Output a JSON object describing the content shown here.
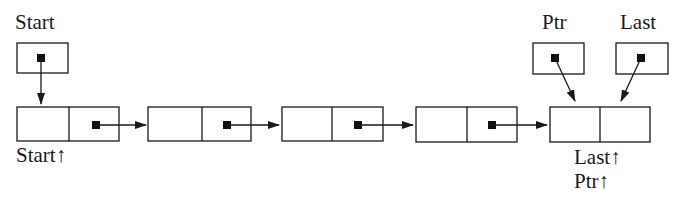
{
  "diagram": {
    "colors": {
      "ink": "#1a1a1a",
      "background": "#ffffff"
    },
    "pointer_variables": [
      {
        "id": "start",
        "label": "Start",
        "points_to": "node1"
      },
      {
        "id": "ptr",
        "label": "Ptr",
        "points_to": "node5"
      },
      {
        "id": "last",
        "label": "Last",
        "points_to": "node5"
      }
    ],
    "nodes": [
      {
        "id": "node1",
        "data": "",
        "next": "node2",
        "labels": [
          "Start↑"
        ]
      },
      {
        "id": "node2",
        "data": "",
        "next": "node3",
        "labels": []
      },
      {
        "id": "node3",
        "data": "",
        "next": "node4",
        "labels": []
      },
      {
        "id": "node4",
        "data": "",
        "next": "node5",
        "labels": []
      },
      {
        "id": "node5",
        "data": "",
        "next": null,
        "labels": [
          "Last↑",
          "Ptr↑"
        ]
      }
    ],
    "text": {
      "start_var": "Start",
      "ptr_var": "Ptr",
      "last_var": "Last",
      "start_deref": "Start↑",
      "last_deref": "Last↑",
      "ptr_deref": "Ptr↑"
    }
  }
}
